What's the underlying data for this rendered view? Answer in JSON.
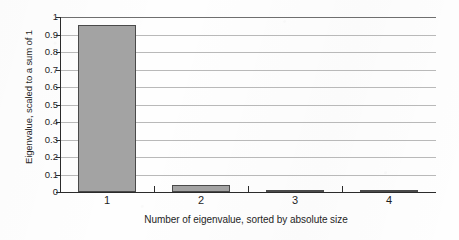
{
  "chart_data": {
    "type": "bar",
    "title": "",
    "subtitle": "",
    "xlabel": "Number of eigenvalue, sorted by absolute size",
    "ylabel": "Eigenvalue, scaled to a sum of 1",
    "categories": [
      "1",
      "2",
      "3",
      "4"
    ],
    "values": [
      0.955,
      0.04,
      0.005,
      0.003
    ],
    "series": [
      {
        "name": "Eigenvalue share",
        "values": [
          0.955,
          0.04,
          0.005,
          0.003
        ]
      }
    ],
    "ylim": [
      0,
      1
    ],
    "xlim_categories": 4,
    "ytick_labels": [
      "0",
      "0.1",
      "0.2",
      "0.3",
      "0.4",
      "0.5",
      "0.6",
      "0.7",
      "0.8",
      "0.9",
      "1"
    ],
    "ytick_values": [
      0,
      0.1,
      0.2,
      0.3,
      0.4,
      0.5,
      0.6,
      0.7,
      0.8,
      0.9,
      1
    ],
    "xtick_labels": [
      "1",
      "2",
      "3",
      "4"
    ],
    "grid": "horizontal",
    "legend": "none",
    "annotations": [],
    "colors": {
      "bar_fill": "#a3a3a3",
      "bar_edge": "#4a4a4a",
      "gridline": "#b9b9b9",
      "axis": "#2b2b2b",
      "text": "#1f1f1f",
      "background": "#fefefe"
    }
  }
}
